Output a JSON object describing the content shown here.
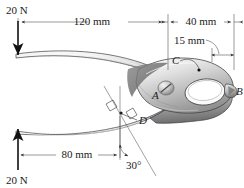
{
  "figure": {
    "forces": [
      {
        "name": "top-force",
        "label": "20 N",
        "direction": "down",
        "x": 18,
        "y_tail": 20,
        "y_head": 56
      },
      {
        "name": "bottom-force",
        "label": "20 N",
        "direction": "up",
        "x": 18,
        "y_tail": 170,
        "y_head": 128
      }
    ],
    "dimensions": [
      {
        "name": "dim-120mm",
        "label": "120 mm",
        "value": 120,
        "unit": "mm",
        "orientation": "horizontal",
        "x1": 18,
        "x2": 168,
        "y": 22
      },
      {
        "name": "dim-40mm",
        "label": "40 mm",
        "value": 40,
        "unit": "mm",
        "orientation": "horizontal",
        "x1": 168,
        "x2": 234,
        "y": 22
      },
      {
        "name": "dim-15mm",
        "label": "15 mm",
        "value": 15,
        "unit": "mm",
        "orientation": "horizontal",
        "x1": 212,
        "x2": 234,
        "y": 55
      },
      {
        "name": "dim-80mm",
        "label": "80 mm",
        "value": 80,
        "unit": "mm",
        "orientation": "horizontal",
        "x1": 18,
        "x2": 120,
        "y": 155
      },
      {
        "name": "angle-30deg",
        "label": "30°",
        "value": 30,
        "unit": "deg",
        "orientation": "angle",
        "vertex_x": 120,
        "vertex_y": 155
      }
    ],
    "points": [
      {
        "name": "point-A",
        "label": "A",
        "x": 157,
        "y": 95,
        "note": "pivot pin"
      },
      {
        "name": "point-B",
        "label": "B",
        "x": 234,
        "y": 92,
        "note": "jaw tip right"
      },
      {
        "name": "point-C",
        "label": "C",
        "x": 176,
        "y": 62,
        "note": "upper jaw contact"
      },
      {
        "name": "point-D",
        "label": "D",
        "x": 143,
        "y": 118,
        "note": "lower link"
      }
    ],
    "colors": {
      "ink": "#1a1a1a",
      "dim_line": "#555555",
      "metal_light": "#f0f0f0",
      "metal_mid": "#c9c9c9",
      "metal_dark": "#8a8a8a",
      "metal_shadow": "#5d5d5d"
    }
  }
}
